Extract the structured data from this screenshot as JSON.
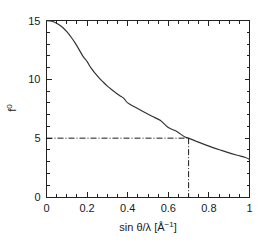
{
  "chart_data": {
    "type": "line",
    "title": "",
    "subtitle": "",
    "xlabel": "sin θ/λ [Å⁻¹]",
    "ylabel": "f⁰",
    "xlim": [
      0,
      1
    ],
    "ylim": [
      0,
      15
    ],
    "grid": false,
    "legend": null,
    "legend_position": "none",
    "x_ticks_major": [
      0,
      0.2,
      0.4,
      0.6,
      0.8,
      1
    ],
    "x_tick_labels": [
      "0",
      "0.2",
      "0.4",
      "0.6",
      "0.8",
      "1"
    ],
    "x_minor_step": 0.05,
    "y_ticks_major": [
      0,
      5,
      10,
      15
    ],
    "y_tick_labels": [
      "0",
      "5",
      "10",
      "15"
    ],
    "y_minor_step": 1,
    "axis_style": "box-with-inward-ticks",
    "series": [
      {
        "name": "f0",
        "style": "solid",
        "color": "#333333",
        "x": [
          0.0,
          0.02,
          0.04,
          0.06,
          0.08,
          0.1,
          0.12,
          0.14,
          0.16,
          0.18,
          0.2,
          0.22,
          0.24,
          0.26,
          0.28,
          0.3,
          0.32,
          0.34,
          0.36,
          0.38,
          0.4,
          0.44,
          0.48,
          0.52,
          0.56,
          0.6,
          0.64,
          0.68,
          0.7,
          0.74,
          0.78,
          0.82,
          0.86,
          0.9,
          0.94,
          0.98,
          1.0
        ],
        "values": [
          15.0,
          14.96,
          14.85,
          14.66,
          14.4,
          14.05,
          13.62,
          13.12,
          12.55,
          11.95,
          11.5,
          10.95,
          10.5,
          10.1,
          9.75,
          9.42,
          9.13,
          8.87,
          8.62,
          8.4,
          8.0,
          7.6,
          7.22,
          6.86,
          6.52,
          5.9,
          5.58,
          5.12,
          5.0,
          4.72,
          4.45,
          4.2,
          3.97,
          3.75,
          3.55,
          3.36,
          3.2
        ]
      }
    ],
    "annotations": [
      {
        "name": "guide-horizontal",
        "type": "line",
        "style": "dash-dot",
        "from": [
          0,
          5
        ],
        "to": [
          0.7,
          5
        ],
        "value": 5
      },
      {
        "name": "guide-vertical",
        "type": "line",
        "style": "dash-dot",
        "from": [
          0.7,
          5
        ],
        "to": [
          0.7,
          0
        ],
        "value": 0.7
      }
    ]
  },
  "axis": {
    "x_title_parts": {
      "sin": "sin",
      "theta": "θ",
      "slash": "/",
      "lambda": "λ",
      "unit_open": "[Å",
      "unit_exp": "−1",
      "unit_close": "]"
    },
    "y_title_base": "f",
    "y_title_exp": "0"
  }
}
